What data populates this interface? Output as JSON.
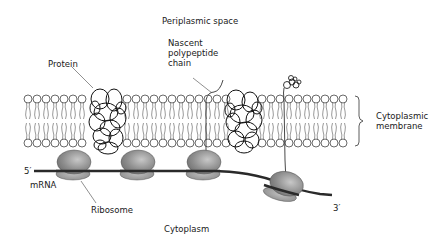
{
  "diagram": {
    "labels": {
      "periplasmic_space": "Periplasmic space",
      "nascent_chain": "Nascent\npolypeptide\nchain",
      "protein": "Protein",
      "cytoplasmic_membrane": "Cytoplasmic\nmembrane",
      "five_prime": "5′",
      "mrna": "mRNA",
      "ribosome": "Ribosome",
      "three_prime": "3′",
      "cytoplasm": "Cytoplasm"
    },
    "colors": {
      "ribosome_fill": "#8a8a8a",
      "ribosome_highlight": "#c4c4c4",
      "mrna": "#2a2a2a",
      "outline": "#1a1a1a",
      "membrane": "#555555"
    }
  }
}
